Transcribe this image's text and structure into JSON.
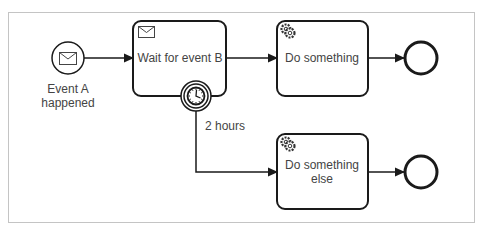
{
  "diagram": {
    "type": "bpmn",
    "colors": {
      "stroke": "#1a1a1a",
      "text": "#444444",
      "frame": "#bbbbbb",
      "fill": "#ffffff"
    },
    "nodes": {
      "start_event": {
        "kind": "message-start-event",
        "icon": "envelope-icon",
        "label_lines": [
          "Event A",
          "happened"
        ]
      },
      "wait_task": {
        "kind": "receive-task",
        "icon": "envelope-icon",
        "label": "Wait for event B"
      },
      "timer_event": {
        "kind": "timer-boundary-event",
        "icon": "clock-icon",
        "label": "2 hours"
      },
      "do_something": {
        "kind": "service-task",
        "icon": "gear-icon",
        "label": "Do something"
      },
      "do_something_else": {
        "kind": "service-task",
        "icon": "gear-icon",
        "label_lines": [
          "Do something",
          "else"
        ]
      },
      "end_event_1": {
        "kind": "end-event"
      },
      "end_event_2": {
        "kind": "end-event"
      }
    },
    "flows": [
      {
        "from": "start_event",
        "to": "wait_task"
      },
      {
        "from": "wait_task",
        "to": "do_something"
      },
      {
        "from": "do_something",
        "to": "end_event_1"
      },
      {
        "from": "timer_event",
        "to": "do_something_else",
        "label": "2 hours"
      },
      {
        "from": "do_something_else",
        "to": "end_event_2"
      }
    ]
  }
}
